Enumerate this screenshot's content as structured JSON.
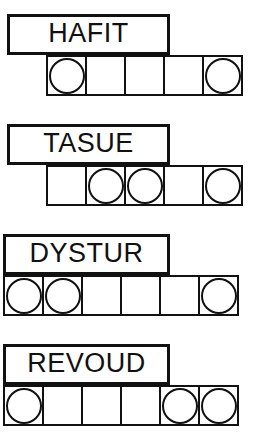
{
  "puzzle": {
    "type": "word-puzzle-answer-grid",
    "colors": {
      "ink": "#111111",
      "paper": "#ffffff"
    },
    "blocks": [
      {
        "word": "HAFIT",
        "cell_count": 5,
        "circled_positions": [
          1,
          5
        ],
        "cells": [
          {
            "index": 1,
            "circled": true
          },
          {
            "index": 2,
            "circled": false
          },
          {
            "index": 3,
            "circled": false
          },
          {
            "index": 4,
            "circled": false
          },
          {
            "index": 5,
            "circled": true
          }
        ]
      },
      {
        "word": "TASUE",
        "cell_count": 5,
        "circled_positions": [
          2,
          3,
          5
        ],
        "cells": [
          {
            "index": 1,
            "circled": false
          },
          {
            "index": 2,
            "circled": true
          },
          {
            "index": 3,
            "circled": true
          },
          {
            "index": 4,
            "circled": false
          },
          {
            "index": 5,
            "circled": true
          }
        ]
      },
      {
        "word": "DYSTUR",
        "cell_count": 6,
        "circled_positions": [
          1,
          2,
          6
        ],
        "cells": [
          {
            "index": 1,
            "circled": true
          },
          {
            "index": 2,
            "circled": true
          },
          {
            "index": 3,
            "circled": false
          },
          {
            "index": 4,
            "circled": false
          },
          {
            "index": 5,
            "circled": false
          },
          {
            "index": 6,
            "circled": true
          }
        ]
      },
      {
        "word": "REVOUD",
        "cell_count": 6,
        "circled_positions": [
          1,
          5,
          6
        ],
        "cells": [
          {
            "index": 1,
            "circled": true
          },
          {
            "index": 2,
            "circled": false
          },
          {
            "index": 3,
            "circled": false
          },
          {
            "index": 4,
            "circled": false
          },
          {
            "index": 5,
            "circled": true
          },
          {
            "index": 6,
            "circled": true
          }
        ]
      }
    ]
  }
}
